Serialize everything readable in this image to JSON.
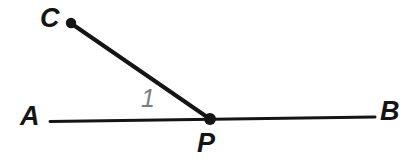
{
  "figure": {
    "background_color": "#ffffff",
    "stroke_color": "#151515",
    "label_color": "#151515",
    "angle_label_color": "#7e7e7e",
    "canvas": {
      "width": 419,
      "height": 167
    }
  },
  "points": [
    {
      "id": "C",
      "label": "C",
      "x": 71,
      "y": 23,
      "dot": true,
      "dot_radius": 5
    },
    {
      "id": "P",
      "label": "P",
      "x": 210,
      "y": 119,
      "dot": true,
      "dot_radius": 6
    },
    {
      "id": "A",
      "label": "A",
      "x": 50,
      "y": 121,
      "dot": false,
      "dot_radius": 0
    },
    {
      "id": "B",
      "label": "B",
      "x": 375,
      "y": 117,
      "dot": false,
      "dot_radius": 0
    }
  ],
  "segments": [
    {
      "id": "line-AB",
      "from": "A",
      "to": "B",
      "width": 3,
      "through": "P"
    },
    {
      "id": "ray-PC",
      "from": "P",
      "to": "C",
      "width": 4
    }
  ],
  "angles": [
    {
      "id": "angle-1",
      "label": "1",
      "vertex": "P",
      "between": [
        "A",
        "C"
      ]
    }
  ],
  "labels": {
    "C": "C",
    "A": "A",
    "B": "B",
    "P": "P",
    "angle_1": "1"
  }
}
